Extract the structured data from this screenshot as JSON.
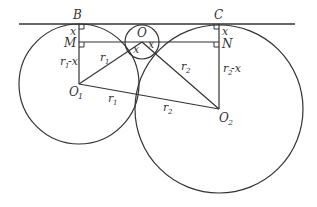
{
  "diagram": {
    "type": "geometry",
    "points": {
      "B": "B",
      "C": "C",
      "M": "M",
      "N": "N",
      "O": "O",
      "O1": "O",
      "O1_sub": "1",
      "O2": "O",
      "O2_sub": "2"
    },
    "labels": {
      "x_left": "x",
      "x_right": "x",
      "x_mid_left": "x",
      "x_mid_right": "x",
      "r1_upper": "r",
      "r1_upper_sub": "1",
      "r1_lower": "r",
      "r1_lower_sub": "1",
      "r2_upper": "r",
      "r2_upper_sub": "2",
      "r2_lower": "r",
      "r2_lower_sub": "2",
      "r1_minus_x": "r",
      "r1_minus_x_sub": "1",
      "r1_minus_x_tail": "-x",
      "r2_minus_x": "r",
      "r2_minus_x_sub": "2",
      "r2_minus_x_tail": "-x"
    },
    "colors": {
      "stroke": "#333333",
      "background": "#ffffff"
    }
  }
}
